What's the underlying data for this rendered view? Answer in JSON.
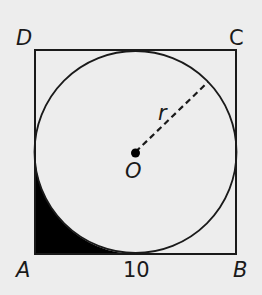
{
  "diagram": {
    "type": "geometry",
    "colors": {
      "background": "#ededed",
      "stroke": "#1a1a1a",
      "shade": "#000000"
    },
    "vertices": {
      "A": "A",
      "B": "B",
      "C": "C",
      "D": "D"
    },
    "center_label": "O",
    "radius_label": "r",
    "side_length_label": "10"
  }
}
